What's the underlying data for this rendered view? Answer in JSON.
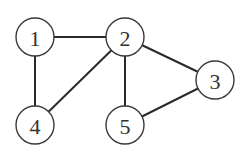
{
  "diagram": {
    "type": "undirected-graph",
    "node_radius": 19,
    "colors": {
      "background": "#ffffff",
      "edge": "#2a2a2a",
      "node_stroke": "#3a3a3a",
      "node_fill": "#ffffff",
      "label": "#333333"
    },
    "nodes": [
      {
        "id": "1",
        "label": "1",
        "x": 35,
        "y": 37
      },
      {
        "id": "2",
        "label": "2",
        "x": 125,
        "y": 37
      },
      {
        "id": "3",
        "label": "3",
        "x": 215,
        "y": 80
      },
      {
        "id": "4",
        "label": "4",
        "x": 35,
        "y": 125
      },
      {
        "id": "5",
        "label": "5",
        "x": 125,
        "y": 125
      }
    ],
    "edges": [
      {
        "from": "1",
        "to": "2"
      },
      {
        "from": "1",
        "to": "4"
      },
      {
        "from": "2",
        "to": "4"
      },
      {
        "from": "2",
        "to": "5"
      },
      {
        "from": "2",
        "to": "3"
      },
      {
        "from": "3",
        "to": "5"
      }
    ]
  }
}
